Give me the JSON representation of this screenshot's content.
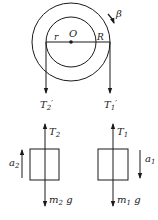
{
  "diagram": {
    "pulley": {
      "center_label": "O",
      "inner_radius_label": "r",
      "outer_radius_label": "R",
      "angular_accel_label": "β"
    },
    "rope_forces": {
      "left": {
        "main": "T",
        "sub": "2",
        "prime": "′"
      },
      "right": {
        "main": "T",
        "sub": "1",
        "prime": "′"
      }
    },
    "block_left": {
      "tension": {
        "main": "T",
        "sub": "2"
      },
      "weight": {
        "m": "m",
        "sub": "2",
        "g": " g"
      },
      "accel": {
        "main": "a",
        "sub": "2"
      }
    },
    "block_right": {
      "tension": {
        "main": "T",
        "sub": "1"
      },
      "weight": {
        "m": "m",
        "sub": "1",
        "g": " g"
      },
      "accel": {
        "main": "a",
        "sub": "1"
      }
    },
    "colors": {
      "stroke": "#1a1a1a",
      "background": "#ffffff"
    }
  }
}
